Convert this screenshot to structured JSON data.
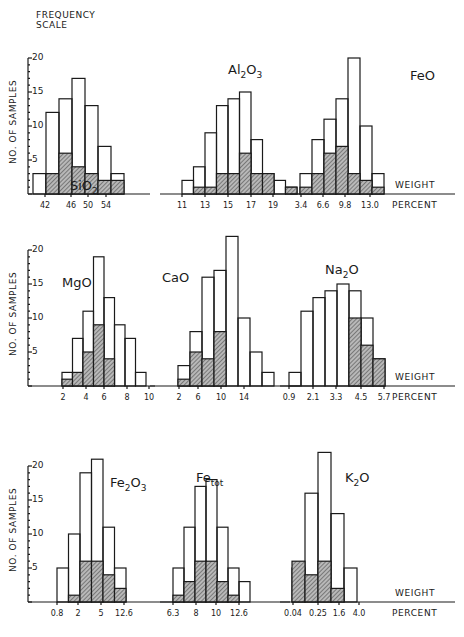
{
  "figure": {
    "frequency_scale_label_1": "FREQUENCY",
    "frequency_scale_label_2": "SCALE",
    "y_axis_label": "NO. OF SAMPLES",
    "x_axis_label_1": "WEIGHT",
    "x_axis_label_2": "PERCENT",
    "y_ticks": [
      "20",
      "15",
      "10",
      "5"
    ]
  },
  "chart_data": [
    {
      "type": "bar",
      "title": "SiO2",
      "title_main": "SiO",
      "title_sub": "2",
      "xlabel": "WEIGHT PERCENT",
      "ylabel": "NO. OF SAMPLES",
      "ylim": [
        0,
        20
      ],
      "tick_labels": [
        "42",
        "46",
        "50",
        "54"
      ],
      "series": [
        {
          "name": "total",
          "values": [
            3,
            12,
            14,
            17,
            13,
            7,
            3
          ]
        },
        {
          "name": "shaded",
          "values": [
            0,
            3,
            6,
            4,
            3,
            2,
            2
          ]
        }
      ]
    },
    {
      "type": "bar",
      "title": "Al2O3",
      "title_main": "Al",
      "title_sub": "2",
      "title_main2": "O",
      "title_sub2": "3",
      "xlabel": "WEIGHT PERCENT",
      "ylim": [
        0,
        20
      ],
      "tick_labels": [
        "11",
        "13",
        "15",
        "17",
        "19"
      ],
      "series": [
        {
          "name": "total",
          "values": [
            2,
            4,
            9,
            13,
            14,
            15,
            8,
            3,
            2,
            1
          ]
        },
        {
          "name": "shaded",
          "values": [
            0,
            1,
            1,
            3,
            3,
            6,
            3,
            3,
            0,
            1
          ]
        }
      ]
    },
    {
      "type": "bar",
      "title": "FeO",
      "title_main": "FeO",
      "xlabel": "WEIGHT PERCENT",
      "ylim": [
        0,
        20
      ],
      "tick_labels": [
        "3.4",
        "6.6",
        "9.8",
        "13.0"
      ],
      "series": [
        {
          "name": "total",
          "values": [
            3,
            8,
            11,
            14,
            20,
            10,
            3
          ]
        },
        {
          "name": "shaded",
          "values": [
            1,
            3,
            6,
            7,
            3,
            2,
            1
          ]
        }
      ]
    },
    {
      "type": "bar",
      "title": "MgO",
      "title_main": "MgO",
      "xlabel": "",
      "ylim": [
        0,
        20
      ],
      "tick_labels": [
        "2",
        "4",
        "6",
        "8",
        "10"
      ],
      "series": [
        {
          "name": "total",
          "values": [
            2,
            7,
            11,
            19,
            13,
            9,
            7,
            2
          ]
        },
        {
          "name": "shaded",
          "values": [
            1,
            2,
            5,
            9,
            4,
            0,
            0,
            0
          ]
        }
      ]
    },
    {
      "type": "bar",
      "title": "CaO",
      "title_main": "CaO",
      "xlabel": "",
      "ylim": [
        0,
        20
      ],
      "tick_labels": [
        "2",
        "6",
        "10",
        "14"
      ],
      "series": [
        {
          "name": "total",
          "values": [
            3,
            8,
            16,
            17,
            22,
            10,
            5,
            2
          ]
        },
        {
          "name": "shaded",
          "values": [
            1,
            5,
            4,
            8,
            0,
            0,
            0,
            0
          ]
        }
      ]
    },
    {
      "type": "bar",
      "title": "Na2O",
      "title_main": "Na",
      "title_sub": "2",
      "title_main2": "O",
      "xlabel": "WEIGHT PERCENT",
      "ylim": [
        0,
        20
      ],
      "tick_labels": [
        "0.9",
        "2.1",
        "3.3",
        "4.5",
        "5.7"
      ],
      "series": [
        {
          "name": "total",
          "values": [
            2,
            11,
            13,
            14,
            15,
            14,
            10,
            4
          ]
        },
        {
          "name": "shaded",
          "values": [
            0,
            0,
            0,
            0,
            0,
            10,
            6,
            4
          ]
        }
      ]
    },
    {
      "type": "bar",
      "title": "Fe2O3",
      "title_main": "Fe",
      "title_sub": "2",
      "title_main2": "O",
      "title_sub2": "3",
      "xlabel": "",
      "ylim": [
        0,
        20
      ],
      "tick_labels": [
        "0.8",
        "2",
        "5",
        "12.6"
      ],
      "series": [
        {
          "name": "total",
          "values": [
            5,
            10,
            19,
            21,
            11,
            5
          ]
        },
        {
          "name": "shaded",
          "values": [
            0,
            1,
            6,
            6,
            4,
            2
          ]
        }
      ]
    },
    {
      "type": "bar",
      "title": "Fetot",
      "title_main": "Fe",
      "title_sub": "tot",
      "xlabel": "",
      "ylim": [
        0,
        20
      ],
      "tick_labels": [
        "6.3",
        "8",
        "10",
        "12.6"
      ],
      "series": [
        {
          "name": "total",
          "values": [
            5,
            11,
            17,
            18,
            11,
            5,
            3
          ]
        },
        {
          "name": "shaded",
          "values": [
            1,
            3,
            6,
            6,
            3,
            1,
            0
          ]
        }
      ]
    },
    {
      "type": "bar",
      "title": "K2O",
      "title_main": "K",
      "title_sub": "2",
      "title_main2": "O",
      "xlabel": "WEIGHT PERCENT",
      "ylim": [
        0,
        20
      ],
      "tick_labels": [
        "0.04",
        "0.25",
        "1.6",
        "4.0"
      ],
      "series": [
        {
          "name": "total",
          "values": [
            5,
            16,
            22,
            13,
            5
          ]
        },
        {
          "name": "shaded",
          "values": [
            6,
            4,
            6,
            2,
            0
          ]
        }
      ]
    }
  ]
}
